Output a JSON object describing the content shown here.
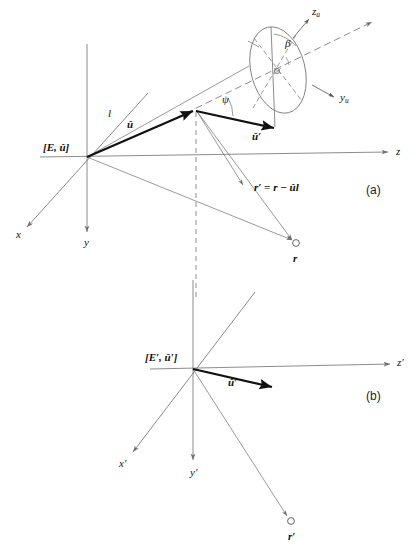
{
  "figure": {
    "background_color": "#ffffff",
    "line_color": "#6f6f6f",
    "bold_line_color": "#111111",
    "text_color": "#111111",
    "panels": [
      {
        "id": "a",
        "label": "(a)",
        "x": 368,
        "y": 186
      },
      {
        "id": "b",
        "label": "(b)",
        "x": 368,
        "y": 398
      }
    ]
  },
  "panel_a": {
    "origin_label": "[E, û]",
    "axes": [
      {
        "name": "x",
        "label": "x",
        "label_x": 16,
        "label_y": 235
      },
      {
        "name": "y",
        "label": "y",
        "label_x": 84,
        "label_y": 243
      },
      {
        "name": "z",
        "label": "z",
        "label_x": 396,
        "label_y": 152
      }
    ],
    "vectors": [
      {
        "name": "u-hat",
        "label": "û",
        "label_x": 127,
        "label_y": 125
      },
      {
        "name": "u-hat-prime",
        "label": "û′",
        "label_x": 254,
        "label_y": 137
      }
    ],
    "segment_length_label": "l",
    "angle_psi": "ψ",
    "angle_beta": "β",
    "rotated_axes": [
      {
        "name": "z-sub-u",
        "label": "z",
        "subscript": "u",
        "label_x": 316,
        "label_y": 8
      },
      {
        "name": "y-sub-u",
        "label": "y",
        "subscript": "u",
        "label_x": 348,
        "label_y": 96
      }
    ],
    "point_r_label": "r",
    "equation": "r′ = r − ûl"
  },
  "panel_b": {
    "origin_label": "[E′, û′]",
    "axes": [
      {
        "name": "x-prime",
        "label": "x′",
        "label_x": 119,
        "label_y": 464
      },
      {
        "name": "y-prime",
        "label": "y′",
        "label_x": 190,
        "label_y": 473
      },
      {
        "name": "z-prime",
        "label": "z′",
        "label_x": 398,
        "label_y": 363
      }
    ],
    "vectors": [
      {
        "name": "u-hat-prime",
        "label": "û′",
        "label_x": 230,
        "label_y": 383
      }
    ],
    "point_r_prime_label": "r′"
  }
}
